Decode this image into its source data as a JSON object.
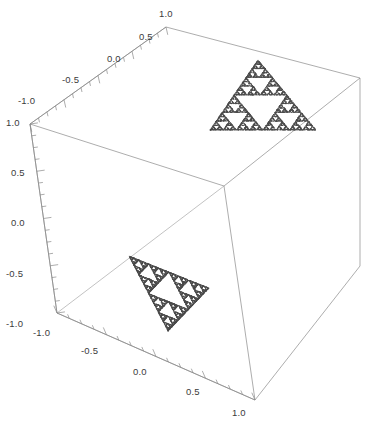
{
  "figure": {
    "kind": "mathematica-3d-plot",
    "background": "#ffffff",
    "frame_color": "#8a8a8a",
    "tick_color": "#8a8a8a",
    "label_color": "#3b3b3b",
    "fractal_color": "#4a4a4a"
  },
  "chart_data": {
    "type": "scatter",
    "title": "",
    "subtitle": "",
    "projection": "3d-box-frame",
    "xlabel": "",
    "ylabel": "",
    "zlabel": "",
    "xlim": [
      -1.0,
      1.0
    ],
    "ylim": [
      -1.0,
      1.0
    ],
    "zlim": [
      -1.0,
      1.0
    ],
    "grid": false,
    "legend": "none",
    "axes": [
      {
        "name": "x-axis",
        "orientation": "front-bottom-right",
        "range": [
          -1.0,
          1.0
        ],
        "ticks": [
          "-1.0",
          "-0.5",
          "0.0",
          "0.5",
          "1.0"
        ],
        "tick_values": [
          -1.0,
          -0.5,
          0.0,
          0.5,
          1.0
        ],
        "minor_ticks_per_interval": 4
      },
      {
        "name": "y-axis",
        "orientation": "top-back-left",
        "range": [
          -1.0,
          1.0
        ],
        "ticks": [
          "-1.0",
          "-0.5",
          "0.0",
          "0.5",
          "1.0"
        ],
        "tick_values": [
          -1.0,
          -0.5,
          0.0,
          0.5,
          1.0
        ],
        "minor_ticks_per_interval": 4
      },
      {
        "name": "z-axis",
        "orientation": "left-vertical",
        "range": [
          -1.0,
          1.0
        ],
        "ticks": [
          "1.0",
          "0.5",
          "0.0",
          "-0.5",
          "-1.0"
        ],
        "tick_values": [
          1.0,
          0.5,
          0.0,
          -0.5,
          -1.0
        ],
        "minor_ticks_per_interval": 4
      }
    ],
    "series": [
      {
        "name": "sierpinski-upper",
        "plane": "horizontal upper",
        "z": 0.5,
        "point_count": 6561,
        "fill": "#4a4a4a",
        "vertices_screen": [
          [
            258,
            60
          ],
          [
            210,
            130
          ],
          [
            316,
            130
          ]
        ]
      },
      {
        "name": "sierpinski-lower",
        "plane": "horizontal lower",
        "z": -0.5,
        "point_count": 6561,
        "fill": "#4a4a4a",
        "vertices_screen": [
          [
            129,
            256
          ],
          [
            168,
            331
          ],
          [
            209,
            288
          ]
        ]
      }
    ]
  },
  "labels": {
    "y_axis": [
      {
        "text": "-1.0",
        "x": 18,
        "y": 95
      },
      {
        "text": "-0.5",
        "x": 62,
        "y": 74
      },
      {
        "text": "0.0",
        "x": 107,
        "y": 53
      },
      {
        "text": "0.5",
        "x": 139,
        "y": 31
      },
      {
        "text": "1.0",
        "x": 159,
        "y": 8
      }
    ],
    "z_axis": [
      {
        "text": "1.0",
        "x": 6,
        "y": 117
      },
      {
        "text": "0.5",
        "x": 11,
        "y": 167
      },
      {
        "text": "0.0",
        "x": 11,
        "y": 217
      },
      {
        "text": "-0.5",
        "x": 6,
        "y": 268
      },
      {
        "text": "-1.0",
        "x": 6,
        "y": 318
      }
    ],
    "x_axis": [
      {
        "text": "-1.0",
        "x": 33,
        "y": 327
      },
      {
        "text": "-0.5",
        "x": 81,
        "y": 345
      },
      {
        "text": "0.0",
        "x": 133,
        "y": 366
      },
      {
        "text": "0.5",
        "x": 186,
        "y": 386
      },
      {
        "text": "1.0",
        "x": 232,
        "y": 407
      }
    ]
  }
}
